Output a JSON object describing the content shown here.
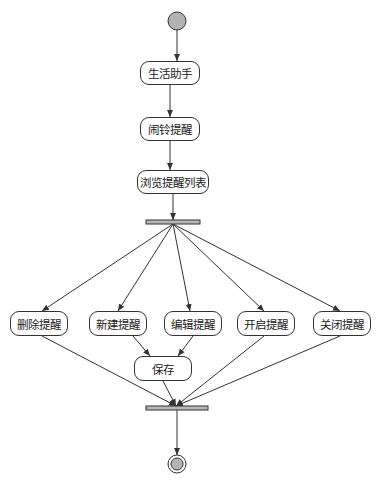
{
  "diagram": {
    "type": "UML activity diagram",
    "colors": {
      "line": "#333333",
      "start_fill": "#b3b3b3",
      "bar_fill": "#b8b8b8"
    },
    "start": {
      "cx": 177,
      "cy": 21,
      "r": 9
    },
    "end": {
      "cx": 177,
      "cy": 464,
      "r": 9
    },
    "fork_bar": {
      "x": 146,
      "y": 220,
      "w": 54,
      "h": 4
    },
    "join_bar": {
      "x": 146,
      "y": 406,
      "w": 62,
      "h": 4
    },
    "nodes": [
      {
        "id": "life_assistant",
        "label": "生活助手",
        "x": 140,
        "y": 61,
        "w": 60,
        "h": 24
      },
      {
        "id": "alarm_reminder",
        "label": "闹铃提醒",
        "x": 140,
        "y": 117,
        "w": 60,
        "h": 24
      },
      {
        "id": "browse_list",
        "label": "浏览提醒列表",
        "x": 137,
        "y": 170,
        "w": 72,
        "h": 24
      },
      {
        "id": "delete_reminder",
        "label": "删除提醒",
        "x": 10,
        "y": 311,
        "w": 58,
        "h": 25
      },
      {
        "id": "new_reminder",
        "label": "新建提醒",
        "x": 89,
        "y": 311,
        "w": 58,
        "h": 25
      },
      {
        "id": "edit_reminder",
        "label": "编辑提醒",
        "x": 164,
        "y": 311,
        "w": 58,
        "h": 25
      },
      {
        "id": "enable_reminder",
        "label": "开启提醒",
        "x": 237,
        "y": 311,
        "w": 58,
        "h": 25
      },
      {
        "id": "disable_reminder",
        "label": "关闭提醒",
        "x": 313,
        "y": 311,
        "w": 58,
        "h": 25
      },
      {
        "id": "save",
        "label": "保存",
        "x": 134,
        "y": 356,
        "w": 58,
        "h": 25
      }
    ],
    "edges": [
      {
        "from": "start",
        "to": "life_assistant",
        "x1": 177,
        "y1": 30,
        "x2": 177,
        "y2": 61
      },
      {
        "from": "life_assistant",
        "to": "alarm_reminder",
        "x1": 170,
        "y1": 85,
        "x2": 170,
        "y2": 117
      },
      {
        "from": "alarm_reminder",
        "to": "browse_list",
        "x1": 170,
        "y1": 141,
        "x2": 170,
        "y2": 170
      },
      {
        "from": "browse_list",
        "to": "fork",
        "x1": 173,
        "y1": 194,
        "x2": 173,
        "y2": 220
      },
      {
        "from": "fork",
        "to": "delete_reminder",
        "x1": 173,
        "y1": 224,
        "x2": 42,
        "y2": 311
      },
      {
        "from": "fork",
        "to": "new_reminder",
        "x1": 173,
        "y1": 224,
        "x2": 118,
        "y2": 311
      },
      {
        "from": "fork",
        "to": "edit_reminder",
        "x1": 173,
        "y1": 224,
        "x2": 190,
        "y2": 311
      },
      {
        "from": "fork",
        "to": "enable_reminder",
        "x1": 173,
        "y1": 224,
        "x2": 264,
        "y2": 311
      },
      {
        "from": "fork",
        "to": "disable_reminder",
        "x1": 173,
        "y1": 224,
        "x2": 340,
        "y2": 311
      },
      {
        "from": "new_reminder",
        "to": "save",
        "x1": 133,
        "y1": 336,
        "x2": 150,
        "y2": 356
      },
      {
        "from": "edit_reminder",
        "to": "save",
        "x1": 193,
        "y1": 336,
        "x2": 178,
        "y2": 356
      },
      {
        "from": "delete_reminder",
        "to": "join",
        "x1": 42,
        "y1": 336,
        "x2": 176,
        "y2": 406
      },
      {
        "from": "save",
        "to": "join",
        "x1": 163,
        "y1": 381,
        "x2": 176,
        "y2": 406
      },
      {
        "from": "enable_reminder",
        "to": "join",
        "x1": 264,
        "y1": 336,
        "x2": 176,
        "y2": 406
      },
      {
        "from": "disable_reminder",
        "to": "join",
        "x1": 340,
        "y1": 336,
        "x2": 176,
        "y2": 406
      },
      {
        "from": "join",
        "to": "end",
        "x1": 177,
        "y1": 410,
        "x2": 177,
        "y2": 455
      }
    ]
  }
}
